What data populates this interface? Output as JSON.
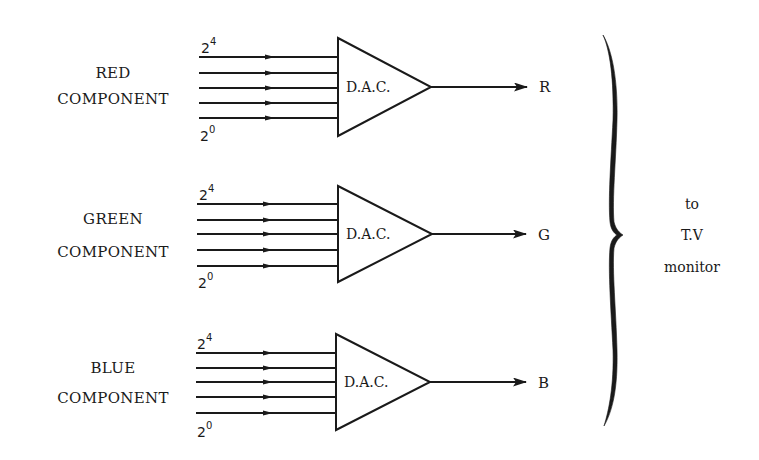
{
  "diagram": {
    "title": "",
    "colors": {
      "ink": "#1a1a1a",
      "background": "#ffffff"
    },
    "channels": [
      {
        "id": "red",
        "label_line1": "RED",
        "label_line2": "COMPONENT",
        "msb_base": "2",
        "msb_exp": "4",
        "lsb_base": "2",
        "lsb_exp": "0",
        "converter_label": "D.A.C.",
        "output_label": "R",
        "input_bits": 5
      },
      {
        "id": "green",
        "label_line1": "GREEN",
        "label_line2": "COMPONENT",
        "msb_base": "2",
        "msb_exp": "4",
        "lsb_base": "2",
        "lsb_exp": "0",
        "converter_label": "D.A.C.",
        "output_label": "G",
        "input_bits": 5
      },
      {
        "id": "blue",
        "label_line1": "BLUE",
        "label_line2": "COMPONENT",
        "msb_base": "2",
        "msb_exp": "4",
        "lsb_base": "2",
        "lsb_exp": "0",
        "converter_label": "D.A.C.",
        "output_label": "B",
        "input_bits": 5
      }
    ],
    "destination": {
      "line1": "to",
      "line2": "T.V",
      "line3": "monitor"
    }
  }
}
